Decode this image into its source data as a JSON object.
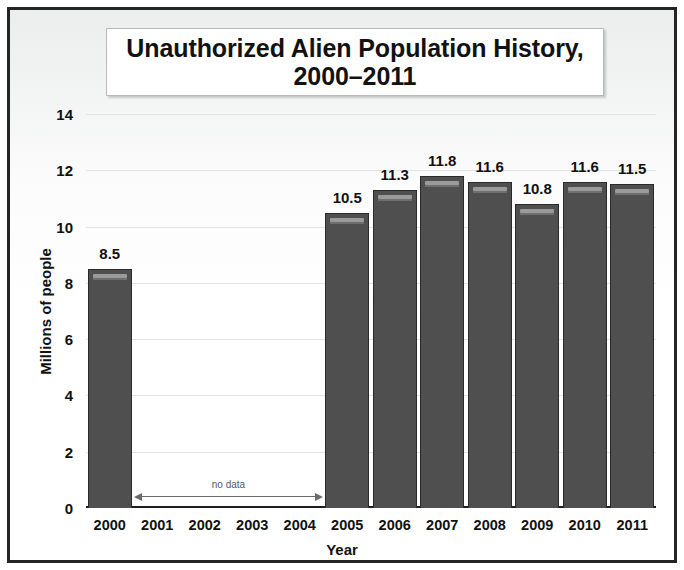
{
  "chart_data": {
    "type": "bar",
    "title": "Unauthorized Alien Population History, 2000–2011",
    "title_line1": "Unauthorized Alien Population History,",
    "title_line2": "2000–2011",
    "xlabel": "Year",
    "ylabel": "Millions of people",
    "ylim": [
      0,
      14
    ],
    "ytick_labels": [
      "0",
      "2",
      "4",
      "6",
      "8",
      "10",
      "12",
      "14"
    ],
    "ytick_values": [
      0,
      2,
      4,
      6,
      8,
      10,
      12,
      14
    ],
    "grid": true,
    "legend": "none",
    "categories": [
      "2000",
      "2001",
      "2002",
      "2003",
      "2004",
      "2005",
      "2006",
      "2007",
      "2008",
      "2009",
      "2010",
      "2011"
    ],
    "values": [
      8.5,
      null,
      null,
      null,
      null,
      10.5,
      11.3,
      11.8,
      11.6,
      10.8,
      11.6,
      11.5
    ],
    "data_labels": [
      "8.5",
      "",
      "",
      "",
      "",
      "10.5",
      "11.3",
      "11.8",
      "11.6",
      "10.8",
      "11.6",
      "11.5"
    ],
    "annotation": {
      "text": "no data",
      "spans_categories": [
        "2001",
        "2002",
        "2003",
        "2004"
      ],
      "style": "double-headed-arrow"
    },
    "colors": {
      "bar_fill": "#4f4f4f",
      "bar_border": "#2a2a2a",
      "bar_highlight": "#9a9a9a",
      "gridline": "#e2e4e4",
      "axis": "#1f1f1f",
      "text": "#111111",
      "frame": "#242424",
      "annotation_text": "#58595b"
    }
  }
}
